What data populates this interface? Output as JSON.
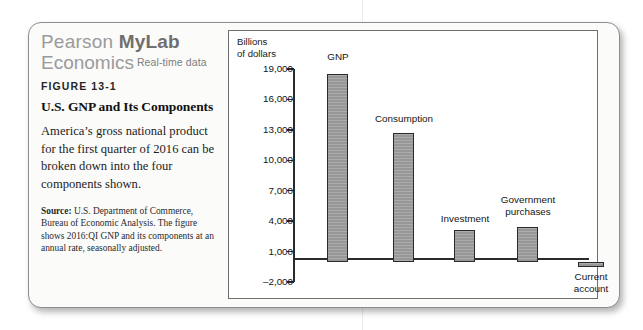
{
  "brand": {
    "line1_prefix": "Pearson ",
    "line1_bold": "MyLab",
    "line2_main": "Economics",
    "line2_tag": "Real-time data"
  },
  "figure": {
    "number": "FIGURE 13-1",
    "title": "U.S. GNP and Its Components",
    "body": "America’s gross national product for the first quarter of 2016 can be broken down into the four components shown.",
    "source_label": "Source:",
    "source_text": " U.S. Department of Commerce, Bureau of Economic Analysis. The figure shows 2016:QI GNP and its components at an annual rate, seasonally adjusted."
  },
  "chart_data": {
    "type": "bar",
    "title": "U.S. GNP and Its Components",
    "xlabel": "",
    "ylabel": "Billions\nof dollars",
    "ylim": [
      -2000,
      19000
    ],
    "yticks": [
      19000,
      16000,
      13000,
      10000,
      7000,
      4000,
      1000,
      -2000
    ],
    "ytick_labels": [
      "19,000",
      "16,000",
      "13,000",
      "10,000",
      "7,000",
      "4,000",
      "1,000",
      "–2,000"
    ],
    "grid": false,
    "legend": "none",
    "categories": [
      "GNP",
      "Consumption",
      "Investment",
      "Government purchases",
      "Current account"
    ],
    "values": [
      18500,
      12700,
      3100,
      3450,
      -500
    ],
    "bar_color": "#9c9c9c",
    "bar_edge_color": "#2a2a2a",
    "axis_color": "#2b2b2b",
    "labels": [
      {
        "text": "GNP",
        "align": "center"
      },
      {
        "text": "Consumption",
        "align": "center"
      },
      {
        "text": "Investment",
        "align": "center"
      },
      {
        "text": "Government\npurchases",
        "align": "center"
      },
      {
        "text": "Current\naccount",
        "align": "center"
      }
    ]
  }
}
